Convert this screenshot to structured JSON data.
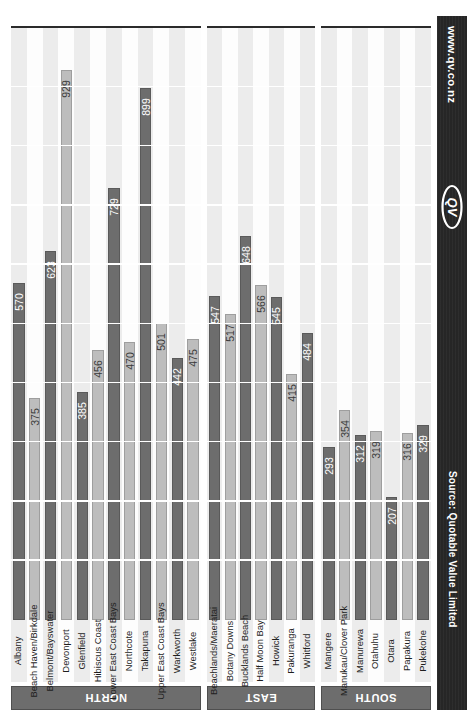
{
  "banner": {
    "url": "www.qv.co.nz",
    "logo_text": "QV",
    "source": "Source: Quotable Value Limited",
    "bg_color": "#262626"
  },
  "colors": {
    "bar_dark": "#6d6d6d",
    "bar_light": "#bdbdbd",
    "stripe_light": "#ececec",
    "stripe_white": "#fdfdfd",
    "axis": "#2b2b2b"
  },
  "chart_data": {
    "type": "bar",
    "orientation": "rotated-vertical",
    "title": "",
    "subtitle": "",
    "xlabel": "",
    "ylabel": "",
    "ylim": [
      0,
      1000
    ],
    "grid": true,
    "gridline_values": [
      100,
      200,
      300,
      400,
      500,
      600,
      700,
      800,
      900,
      1000
    ],
    "legend": [],
    "annotations": [],
    "panels": [
      {
        "region": "NORTH",
        "categories": [
          "Albany",
          "Beach Haven/Birkdale",
          "Belmont/Bayswater",
          "Devonport",
          "Glenfield",
          "Hibiscus Coast",
          "Lower East Coast Bays",
          "Northcote",
          "Takapuna",
          "Upper East Coast Bays",
          "Warkworth",
          "Westlake"
        ],
        "values": [
          570,
          375,
          623,
          929,
          385,
          456,
          729,
          470,
          899,
          501,
          442,
          475
        ]
      },
      {
        "region": "EAST",
        "categories": [
          "Beachlands/Maeratai",
          "Botany Downs",
          "Bucklands Beach",
          "Half Moon Bay",
          "Howick",
          "Pakuranga",
          "Whitford"
        ],
        "values": [
          547,
          517,
          648,
          566,
          545,
          415,
          484
        ]
      },
      {
        "region": "SOUTH",
        "categories": [
          "Mangere",
          "Manukau/Clover Park",
          "Manurewa",
          "Otahuhu",
          "Otara",
          "Papakura",
          "Pukekohe"
        ],
        "values": [
          293,
          354,
          312,
          319,
          207,
          316,
          329
        ]
      }
    ]
  }
}
